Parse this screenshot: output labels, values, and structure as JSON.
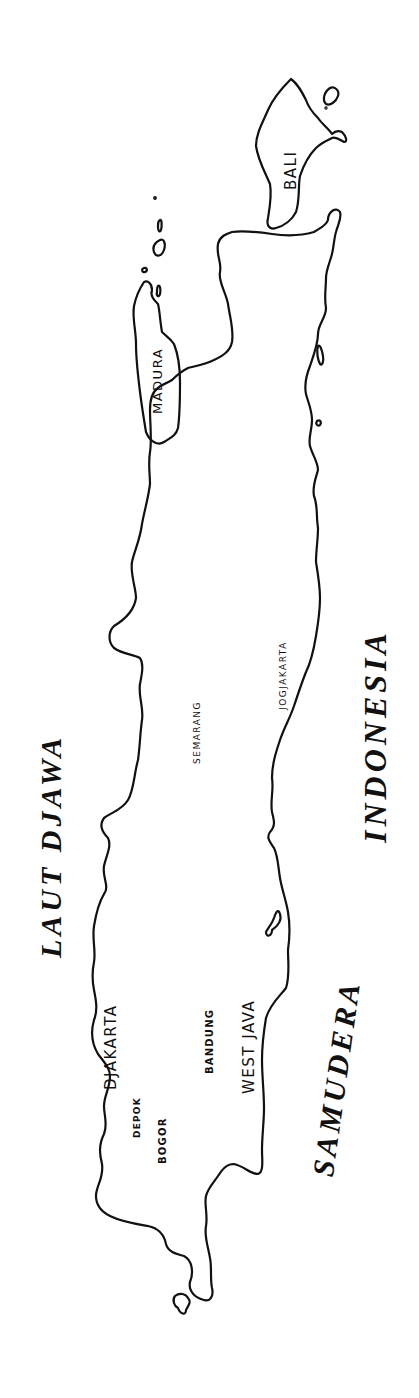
{
  "map": {
    "title": "Java",
    "orientation": "rotated 90 degrees counter-clockwise",
    "colors": {
      "background": "#ffffff",
      "ink": "#111111"
    },
    "seas": [
      {
        "id": "north_sea",
        "label": "LAUT DJAWA"
      },
      {
        "id": "south_sea_1",
        "label": "SAMUDERA"
      },
      {
        "id": "south_sea_2",
        "label": "INDONESIA"
      }
    ],
    "islands": [
      {
        "id": "bali",
        "label": "BALI"
      },
      {
        "id": "madura",
        "label": "MADURA"
      }
    ],
    "regions": [
      {
        "id": "west_java",
        "label": "WEST JAVA"
      }
    ],
    "cities": [
      {
        "id": "djakarta",
        "label": "DJAKARTA"
      },
      {
        "id": "depok",
        "label": "DEPOK"
      },
      {
        "id": "bogor",
        "label": "BOGOR"
      },
      {
        "id": "bandung",
        "label": "BANDUNG"
      },
      {
        "id": "semarang",
        "label": "SEMARANG"
      },
      {
        "id": "jogjakarta",
        "label": "JOGJAKARTA"
      }
    ]
  }
}
